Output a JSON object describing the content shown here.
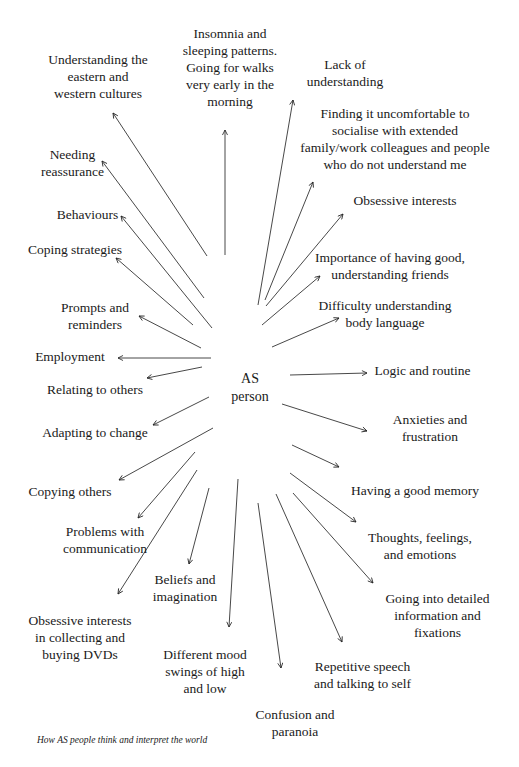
{
  "diagram": {
    "center": "AS\nperson",
    "caption": "How AS people think and interpret the world",
    "nodes": [
      {
        "id": "understanding-cultures",
        "text": "Understanding the\neastern and\nwestern cultures",
        "x": 18,
        "y": 51,
        "w": 160,
        "arrow": [
          207,
          256,
          113,
          113
        ]
      },
      {
        "id": "insomnia",
        "text": "Insomnia and\nsleeping patterns.\nGoing for walks\nvery early in the\nmorning",
        "x": 175,
        "y": 25,
        "w": 110,
        "arrow": [
          225,
          255,
          225,
          130
        ]
      },
      {
        "id": "lack-of-understanding",
        "text": "Lack of\nunderstanding",
        "x": 290,
        "y": 56,
        "w": 110,
        "arrow": [
          258,
          305,
          293,
          100
        ]
      },
      {
        "id": "uncomfortable-socialise",
        "text": "Finding it uncomfortable to\nsocialise with extended\nfamily/work colleagues and people\nwho do not understand me",
        "x": 295,
        "y": 105,
        "w": 200,
        "arrow": [
          265,
          300,
          313,
          182
        ]
      },
      {
        "id": "obsessive-interests",
        "text": "Obsessive interests",
        "x": 330,
        "y": 192,
        "w": 150,
        "arrow": [
          266,
          306,
          343,
          214
        ]
      },
      {
        "id": "good-friends",
        "text": "Importance of having good,\nunderstanding friends",
        "x": 305,
        "y": 249,
        "w": 170,
        "arrow": [
          262,
          325,
          320,
          276
        ]
      },
      {
        "id": "body-language",
        "text": "Difficulty understanding\nbody language",
        "x": 310,
        "y": 297,
        "w": 150,
        "arrow": [
          272,
          347,
          339,
          318
        ]
      },
      {
        "id": "logic-routine",
        "text": "Logic and routine",
        "x": 365,
        "y": 362,
        "w": 115,
        "arrow": [
          290,
          375,
          367,
          373
        ]
      },
      {
        "id": "anxieties",
        "text": "Anxieties and\nfrustration",
        "x": 375,
        "y": 411,
        "w": 110,
        "arrow": [
          282,
          404,
          367,
          431
        ]
      },
      {
        "id": "good-memory",
        "text": "Having a good memory",
        "x": 340,
        "y": 482,
        "w": 150,
        "arrow": [
          292,
          445,
          339,
          467
        ]
      },
      {
        "id": "thoughts-feelings",
        "text": "Thoughts, feelings,\nand emotions",
        "x": 365,
        "y": 529,
        "w": 110,
        "arrow": [
          290,
          473,
          356,
          522
        ]
      },
      {
        "id": "detailed-info",
        "text": "Going into detailed\ninformation and\nfixations",
        "x": 375,
        "y": 590,
        "w": 125,
        "arrow": [
          293,
          493,
          373,
          583
        ]
      },
      {
        "id": "repetitive-speech",
        "text": "Repetitive speech\nand talking to self",
        "x": 300,
        "y": 658,
        "w": 125,
        "arrow": [
          276,
          494,
          342,
          642
        ]
      },
      {
        "id": "confusion-paranoia",
        "text": "Confusion and\nparanoia",
        "x": 240,
        "y": 706,
        "w": 110,
        "arrow": [
          258,
          503,
          281,
          668
        ]
      },
      {
        "id": "mood-swings",
        "text": "Different mood\nswings of high\nand low",
        "x": 150,
        "y": 646,
        "w": 110,
        "arrow": [
          238,
          479,
          229,
          627
        ]
      },
      {
        "id": "beliefs-imagination",
        "text": "Beliefs and\nimagination",
        "x": 135,
        "y": 571,
        "w": 100,
        "arrow": [
          209,
          488,
          189,
          564
        ]
      },
      {
        "id": "collecting-dvds",
        "text": "Obsessive interests\nin collecting and\nbuying DVDs",
        "x": 20,
        "y": 612,
        "w": 120,
        "arrow": [
          197,
          470,
          118,
          594
        ]
      },
      {
        "id": "problems-communication",
        "text": "Problems with\ncommunication",
        "x": 45,
        "y": 523,
        "w": 120,
        "arrow": [
          195,
          452,
          138,
          518
        ]
      },
      {
        "id": "copying-others",
        "text": "Copying others",
        "x": 20,
        "y": 483,
        "w": 100,
        "arrow": [
          213,
          428,
          119,
          480
        ]
      },
      {
        "id": "adapting-change",
        "text": "Adapting to change",
        "x": 35,
        "y": 424,
        "w": 120,
        "arrow": [
          209,
          397,
          153,
          425
        ]
      },
      {
        "id": "relating-others",
        "text": "Relating to others",
        "x": 35,
        "y": 381,
        "w": 120,
        "arrow": [
          202,
          367,
          147,
          378
        ]
      },
      {
        "id": "employment",
        "text": "Employment",
        "x": 25,
        "y": 348,
        "w": 90,
        "arrow": [
          211,
          358,
          118,
          358
        ]
      },
      {
        "id": "prompts-reminders",
        "text": "Prompts and\nreminders",
        "x": 50,
        "y": 299,
        "w": 90,
        "arrow": [
          201,
          348,
          139,
          316
        ]
      },
      {
        "id": "coping-strategies",
        "text": "Coping strategies",
        "x": 20,
        "y": 241,
        "w": 110,
        "arrow": [
          193,
          325,
          116,
          258
        ]
      },
      {
        "id": "behaviours",
        "text": "Behaviours",
        "x": 50,
        "y": 206,
        "w": 75,
        "arrow": [
          212,
          328,
          121,
          216
        ]
      },
      {
        "id": "needing-reassurance",
        "text": "Needing\nreassurance",
        "x": 25,
        "y": 146,
        "w": 95,
        "arrow": [
          204,
          298,
          102,
          161
        ]
      }
    ]
  }
}
